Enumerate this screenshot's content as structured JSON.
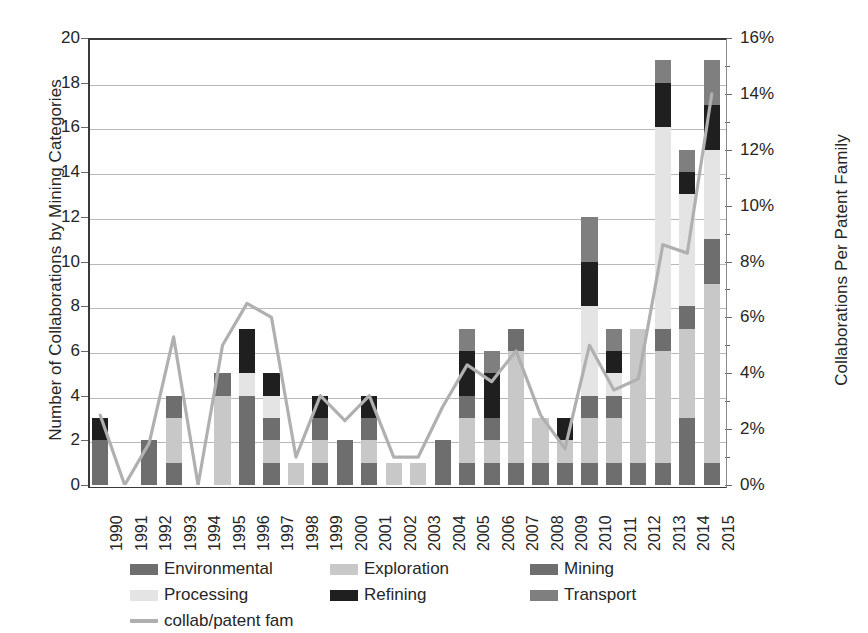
{
  "chart_data": {
    "type": "bar",
    "title": "",
    "subtitle": "",
    "xlabel": "",
    "ylabel": "Number of Collaborations by Mining Categories",
    "y2label": "Collaborations Per Patent Family",
    "ylim": [
      0,
      20
    ],
    "y2lim": [
      0,
      16
    ],
    "ytick_labels": [
      "20",
      "18",
      "16",
      "14",
      "12",
      "10",
      "8",
      "6",
      "4",
      "2",
      "0"
    ],
    "ytick_values": [
      20,
      18,
      16,
      14,
      12,
      10,
      8,
      6,
      4,
      2,
      0
    ],
    "y2tick_labels": [
      "16%",
      "14%",
      "12%",
      "10%",
      "8%",
      "6%",
      "4%",
      "2%",
      "0%"
    ],
    "y2tick_values": [
      16,
      14,
      12,
      10,
      8,
      6,
      4,
      2,
      0
    ],
    "grid": true,
    "stacked": true,
    "legend_position": "bottom",
    "categories": [
      "1990",
      "1991",
      "1992",
      "1993",
      "1994",
      "1995",
      "1996",
      "1997",
      "1998",
      "1999",
      "2000",
      "2001",
      "2002",
      "2003",
      "2004",
      "2005",
      "2006",
      "2007",
      "2008",
      "2009",
      "2010",
      "2011",
      "2012",
      "2013",
      "2014",
      "2015"
    ],
    "series": [
      {
        "name": "Environmental",
        "color": "#6e6e6e",
        "axis": "left",
        "values": [
          1,
          0,
          1,
          1,
          0,
          0,
          2,
          1,
          0,
          1,
          1,
          1,
          0,
          0,
          1,
          1,
          1,
          1,
          1,
          1,
          1,
          1,
          1,
          1,
          3,
          1
        ]
      },
      {
        "name": "Exploration",
        "color": "#c8c8c8",
        "axis": "left",
        "values": [
          0,
          0,
          0,
          2,
          0,
          4,
          0,
          1,
          1,
          1,
          0,
          1,
          1,
          1,
          0,
          2,
          1,
          5,
          2,
          1,
          2,
          2,
          6,
          5,
          4,
          8
        ]
      },
      {
        "name": "Mining",
        "color": "#6e6e6e",
        "axis": "left",
        "values": [
          1,
          0,
          1,
          1,
          0,
          1,
          2,
          1,
          0,
          1,
          1,
          1,
          0,
          0,
          1,
          1,
          1,
          1,
          0,
          0,
          1,
          1,
          0,
          1,
          1,
          2
        ]
      },
      {
        "name": "Processing",
        "color": "#e4e4e4",
        "axis": "left",
        "values": [
          0,
          0,
          0,
          0,
          0,
          0,
          1,
          1,
          0,
          0,
          0,
          0,
          0,
          0,
          0,
          0,
          0,
          0,
          0,
          0,
          4,
          1,
          0,
          9,
          5,
          4
        ]
      },
      {
        "name": "Refining",
        "color": "#1f1f1f",
        "axis": "left",
        "values": [
          1,
          0,
          0,
          0,
          0,
          0,
          2,
          1,
          0,
          1,
          0,
          1,
          0,
          0,
          0,
          2,
          2,
          0,
          0,
          1,
          2,
          1,
          0,
          2,
          1,
          2
        ]
      },
      {
        "name": "Transport",
        "color": "#7f7f7f",
        "axis": "left",
        "values": [
          0,
          0,
          0,
          0,
          0,
          0,
          0,
          0,
          0,
          0,
          0,
          0,
          0,
          0,
          0,
          1,
          1,
          0,
          0,
          0,
          2,
          1,
          0,
          1,
          1,
          2
        ]
      }
    ],
    "stack_order": [
      "Environmental",
      "Exploration",
      "Mining",
      "Processing",
      "Refining",
      "Transport"
    ],
    "bar_totals": [
      3,
      0,
      2,
      4,
      0,
      5,
      7,
      5,
      1,
      4,
      2,
      4,
      1,
      1,
      2,
      7,
      7,
      7,
      3,
      3,
      12,
      7,
      7,
      19,
      15,
      19
    ],
    "line_series": {
      "name": "collab/patent fam",
      "color": "#b0b0b0",
      "axis": "right",
      "unit": "%",
      "values": [
        2.5,
        0.0,
        1.5,
        5.3,
        0.0,
        5.0,
        6.5,
        6.0,
        1.0,
        3.2,
        2.3,
        3.2,
        1.0,
        1.0,
        2.8,
        4.3,
        3.7,
        4.8,
        2.5,
        1.3,
        5.0,
        3.4,
        3.8,
        8.6,
        8.3,
        14.0
      ]
    }
  },
  "legend": {
    "rows": [
      [
        {
          "label": "Environmental",
          "color": "#6e6e6e",
          "kind": "swatch"
        },
        {
          "label": "Exploration",
          "color": "#c8c8c8",
          "kind": "swatch"
        },
        {
          "label": "Mining",
          "color": "#6e6e6e",
          "kind": "swatch"
        }
      ],
      [
        {
          "label": "Processing",
          "color": "#e4e4e4",
          "kind": "swatch"
        },
        {
          "label": "Refining",
          "color": "#1f1f1f",
          "kind": "swatch"
        },
        {
          "label": "Transport",
          "color": "#7f7f7f",
          "kind": "swatch"
        }
      ],
      [
        {
          "label": "collab/patent fam",
          "color": "#b0b0b0",
          "kind": "line"
        }
      ]
    ]
  }
}
